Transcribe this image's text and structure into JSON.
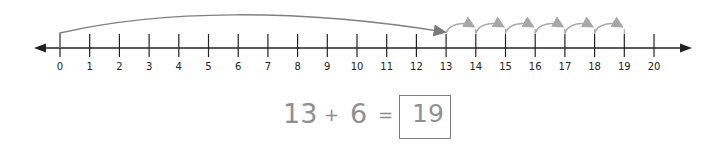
{
  "number_line": {
    "min": 0,
    "max": 20,
    "tick_labels": [
      "0",
      "1",
      "2",
      "3",
      "4",
      "5",
      "6",
      "7",
      "8",
      "9",
      "10",
      "11",
      "12",
      "13",
      "14",
      "15",
      "16",
      "17",
      "18",
      "19",
      "20"
    ],
    "start_jump": {
      "from": 0,
      "to": 13
    },
    "hops": [
      [
        13,
        14
      ],
      [
        14,
        15
      ],
      [
        15,
        16
      ],
      [
        16,
        17
      ],
      [
        17,
        18
      ],
      [
        18,
        19
      ]
    ],
    "axis_color": "#222222",
    "arc_color": "#808080",
    "hop_color": "#a8a8a8"
  },
  "equation": {
    "addend1": "13",
    "plus": "+",
    "addend2": "6",
    "equals": "=",
    "answer": "19",
    "text_color": "#8f8f8f"
  }
}
